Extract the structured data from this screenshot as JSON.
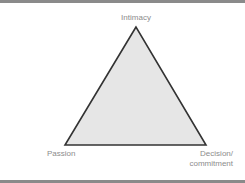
{
  "diagram": {
    "type": "triangle",
    "vertices": {
      "top": "Intimacy",
      "bottom_left": "Passion",
      "bottom_right_line1": "Decision/",
      "bottom_right_line2": "commitment"
    },
    "colors": {
      "fill": "#e6e6e6",
      "stroke": "#333333",
      "label": "#8c8c8c",
      "frame": "#8a8a8a"
    }
  }
}
